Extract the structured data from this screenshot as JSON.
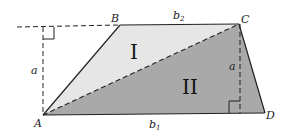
{
  "diagram": {
    "vertices": {
      "A": {
        "label": "A",
        "x": 43,
        "y": 115
      },
      "B": {
        "label": "B",
        "x": 120,
        "y": 25
      },
      "C": {
        "label": "C",
        "x": 239,
        "y": 24
      },
      "D": {
        "label": "D",
        "x": 265,
        "y": 113
      }
    },
    "regions": [
      {
        "id": "triangle-I",
        "label": "I",
        "vertices": [
          "A",
          "B",
          "C"
        ],
        "fill": "#e6e6e6"
      },
      {
        "id": "triangle-II",
        "label": "II",
        "vertices": [
          "A",
          "C",
          "D"
        ],
        "fill": "#a9a9a9"
      }
    ],
    "edge_labels": {
      "top_base": "b",
      "top_base_sub": "2",
      "bottom_base": "b",
      "bottom_base_sub": "1",
      "height_left": "a",
      "height_right": "a"
    },
    "colors": {
      "stroke": "#222222",
      "light_fill": "#e6e6e6",
      "dark_fill": "#a9a9a9"
    }
  }
}
